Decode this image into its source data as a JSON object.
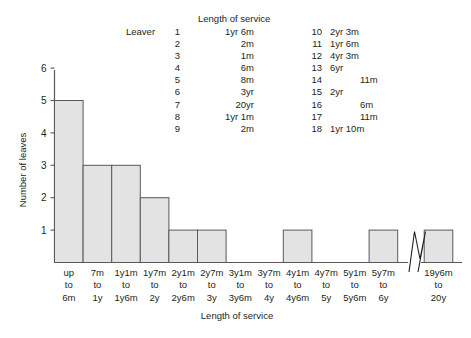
{
  "table": {
    "caption": "Length of service",
    "row_header": "Leaver",
    "left_column": [
      {
        "index": "1",
        "value": "1yr 6m"
      },
      {
        "index": "2",
        "value": "2m"
      },
      {
        "index": "3",
        "value": "1m"
      },
      {
        "index": "4",
        "value": "6m"
      },
      {
        "index": "5",
        "value": "8m"
      },
      {
        "index": "6",
        "value": "3yr"
      },
      {
        "index": "7",
        "value": "20yr"
      },
      {
        "index": "8",
        "value": "1yr 1m"
      },
      {
        "index": "9",
        "value": "2m"
      }
    ],
    "right_column": [
      {
        "index": "10",
        "value": "2yr 3m",
        "indent": 0
      },
      {
        "index": "11",
        "value": "1yr 6m",
        "indent": 0
      },
      {
        "index": "12",
        "value": "4yr 3m",
        "indent": 0
      },
      {
        "index": "13",
        "value": "6yr",
        "indent": 0
      },
      {
        "index": "14",
        "value": "11m",
        "indent": 2
      },
      {
        "index": "15",
        "value": "2yr",
        "indent": 0
      },
      {
        "index": "16",
        "value": "6m",
        "indent": 2
      },
      {
        "index": "17",
        "value": "11m",
        "indent": 2
      },
      {
        "index": "18",
        "value": "1yr 10m",
        "indent": 0
      }
    ]
  },
  "chart_data": {
    "type": "bar",
    "title": "",
    "xlabel": "Length of service",
    "ylabel": "Number of leaves",
    "ylim": [
      0,
      6
    ],
    "yticks": [
      1,
      2,
      3,
      4,
      5,
      6
    ],
    "ytick_labels": [
      "1",
      "2",
      "3",
      "4",
      "5",
      "6"
    ],
    "grid": false,
    "legend": "none",
    "axis_break": {
      "present": true,
      "between_categories": [
        "5y7m to 6y",
        "19y6m to 20y"
      ],
      "symbol": "zigzag"
    },
    "categories": [
      "up to 6m",
      "7m to 1y",
      "1y1m to 1y6m",
      "1y7m to 2y",
      "2y1m to 2y6m",
      "2y7m to 3y",
      "3y1m to 3y6m",
      "3y7m to 4y",
      "4y1m to 4y6m",
      "4y7m to 5y",
      "5y1m to 5y6m",
      "5y7m to 6y",
      "19y6m to 20y"
    ],
    "tick_label_lines": [
      [
        "up",
        "to",
        "6m"
      ],
      [
        "7m",
        "to",
        "1y"
      ],
      [
        "1y1m",
        "to",
        "1y6m"
      ],
      [
        "1y7m",
        "to",
        "2y"
      ],
      [
        "2y1m",
        "to",
        "2y6m"
      ],
      [
        "2y7m",
        "to",
        "3y"
      ],
      [
        "3y1m",
        "to",
        "3y6m"
      ],
      [
        "3y7m",
        "to",
        "4y"
      ],
      [
        "4y1m",
        "to",
        "4y6m"
      ],
      [
        "4y7m",
        "to",
        "5y"
      ],
      [
        "5y1m",
        "to",
        "5y6m"
      ],
      [
        "5y7m",
        "to",
        "6y"
      ],
      [
        "19y6m",
        "to",
        "20y"
      ]
    ],
    "values": [
      5,
      3,
      3,
      2,
      1,
      1,
      0,
      0,
      1,
      0,
      0,
      1,
      1
    ],
    "bar_color": "#e3e3e3",
    "bar_edge_color": "#58595b"
  }
}
